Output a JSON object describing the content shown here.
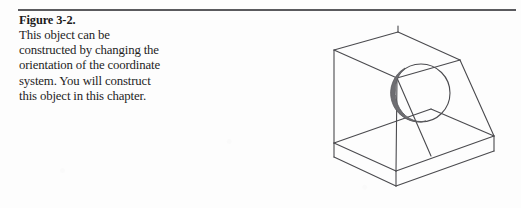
{
  "page": {
    "background_color": "#fdfdfd",
    "ink_color": "#3a3a3e",
    "rule_color": "#5a5a5e"
  },
  "caption": {
    "title": "Figure 3-2.",
    "lines": [
      "This object can be",
      "constructed by changing the",
      "orientation of the coordinate",
      "system. You will construct",
      "this object in this chapter."
    ],
    "full_text": "This object can be constructed by changing the orientation of the coordinate system. You will construct this object in this chapter."
  },
  "figure": {
    "label": "isometric-wedge-block-with-hole",
    "line_color": "#4a4a4e",
    "hole_shade_color": "#6e6e72",
    "features": [
      "rectangular base box",
      "inclined ramp face",
      "vertical back face",
      "circular through-hole on inclined face"
    ]
  }
}
